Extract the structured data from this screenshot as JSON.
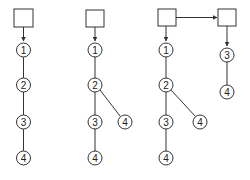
{
  "diagram": {
    "colors": {
      "stroke": "#333333",
      "background": "#ffffff"
    },
    "panels": [
      {
        "id": "panel-1",
        "boxes": [
          {
            "id": "box-a"
          }
        ],
        "nodes": [
          {
            "id": "p1n1",
            "label": "1"
          },
          {
            "id": "p1n2",
            "label": "2"
          },
          {
            "id": "p1n3",
            "label": "3"
          },
          {
            "id": "p1n4",
            "label": "4"
          }
        ],
        "edges": [
          [
            "box-a",
            "p1n1",
            "arrow"
          ],
          [
            "p1n1",
            "p1n2"
          ],
          [
            "p1n2",
            "p1n3"
          ],
          [
            "p1n3",
            "p1n4"
          ]
        ]
      },
      {
        "id": "panel-2",
        "boxes": [
          {
            "id": "box-b"
          }
        ],
        "nodes": [
          {
            "id": "p2n1",
            "label": "1"
          },
          {
            "id": "p2n2",
            "label": "2"
          },
          {
            "id": "p2n3",
            "label": "3"
          },
          {
            "id": "p2n4",
            "label": "4"
          },
          {
            "id": "p2n4b",
            "label": "4"
          }
        ],
        "edges": [
          [
            "box-b",
            "p2n1",
            "arrow"
          ],
          [
            "p2n1",
            "p2n2"
          ],
          [
            "p2n2",
            "p2n3"
          ],
          [
            "p2n3",
            "p2n4"
          ],
          [
            "p2n2",
            "p2n4b"
          ]
        ]
      },
      {
        "id": "panel-3",
        "boxes": [
          {
            "id": "box-c"
          },
          {
            "id": "box-d"
          }
        ],
        "nodes": [
          {
            "id": "p3n1",
            "label": "1"
          },
          {
            "id": "p3n2",
            "label": "2"
          },
          {
            "id": "p3n3",
            "label": "3"
          },
          {
            "id": "p3n4",
            "label": "4"
          },
          {
            "id": "p3n4b",
            "label": "4"
          },
          {
            "id": "p3r3",
            "label": "3"
          },
          {
            "id": "p3r4",
            "label": "4"
          }
        ],
        "edges": [
          [
            "box-c",
            "p3n1",
            "arrow"
          ],
          [
            "p3n1",
            "p3n2"
          ],
          [
            "p3n2",
            "p3n3"
          ],
          [
            "p3n3",
            "p3n4"
          ],
          [
            "p3n2",
            "p3n4b"
          ],
          [
            "box-c",
            "box-d",
            "arrow"
          ],
          [
            "box-d",
            "p3r3",
            "arrow"
          ],
          [
            "p3r3",
            "p3r4"
          ]
        ]
      }
    ]
  }
}
